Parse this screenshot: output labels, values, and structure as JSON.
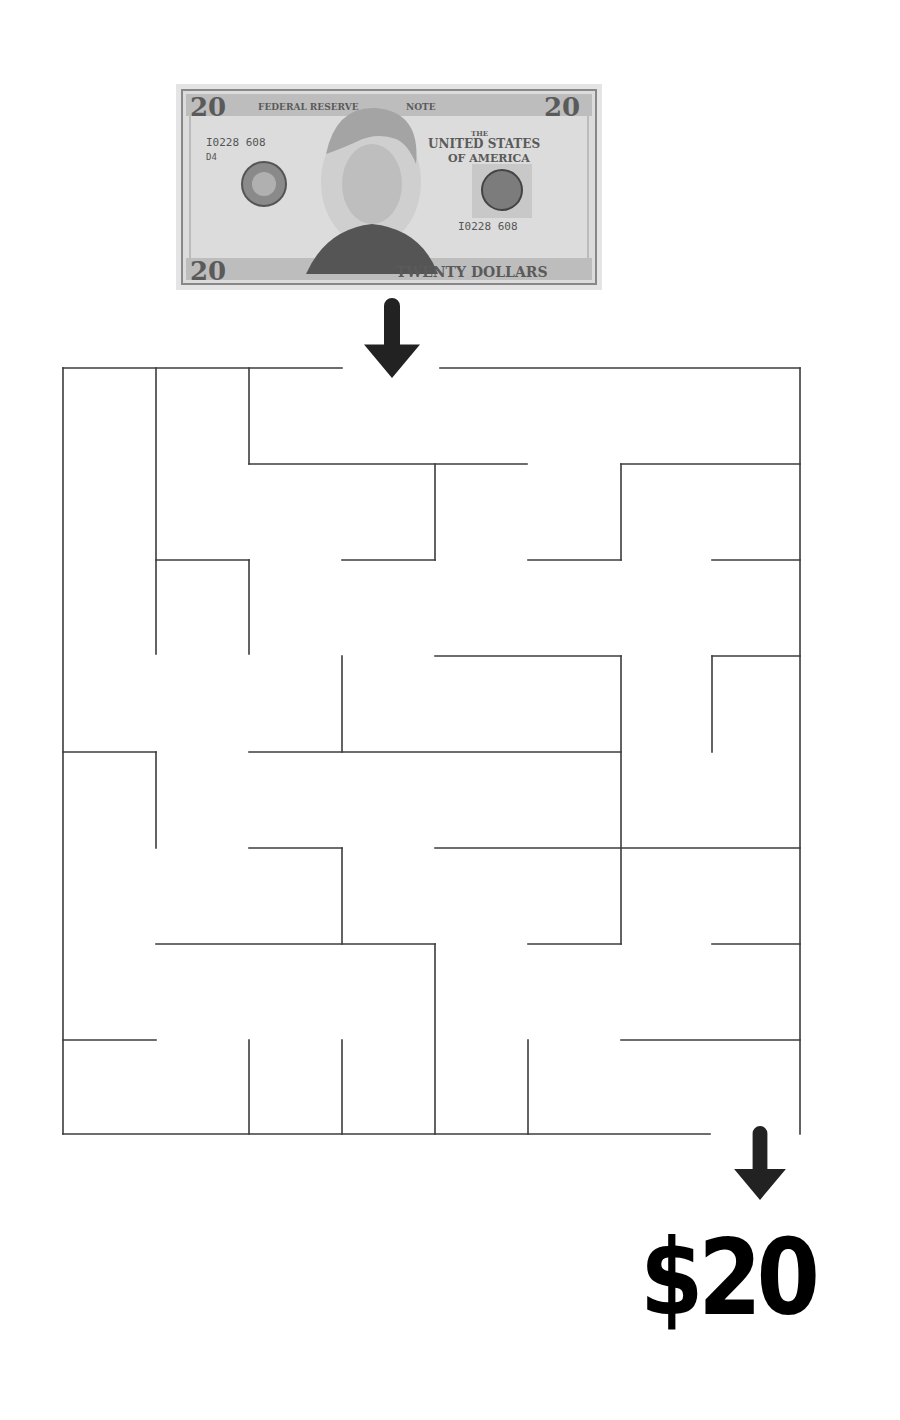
{
  "puzzle": {
    "type": "maze",
    "start_label": "$20 bill image",
    "goal_label": "$20"
  },
  "bill": {
    "denomination_corner": "20",
    "header_left": "FEDERAL RESERVE",
    "header_right": "NOTE",
    "country_line1": "THE",
    "country_line2": "UNITED STATES",
    "country_line3": "OF AMERICA",
    "serial_left": "I0228 608",
    "serial_left_sub": "D4",
    "serial_right": "I0228 608",
    "footer_text": "TWENTY DOLLARS"
  },
  "prize": {
    "text": "$20"
  },
  "colors": {
    "wall": "#3c3c3c",
    "arrow": "#222222",
    "prize": "#000000",
    "bill_bg": "#e4e4e4"
  },
  "maze": {
    "stroke_width": 1.6,
    "cols": 8,
    "rows": 8,
    "x_grid": [
      63,
      156,
      249,
      342,
      435,
      528,
      621,
      714,
      800
    ],
    "y_grid": [
      368,
      464,
      560,
      656,
      752,
      848,
      944,
      1040,
      1134
    ],
    "entrance": {
      "x1": 342,
      "x2": 440,
      "y": 368
    },
    "exit": {
      "x1": 710,
      "x2": 800,
      "y": 1134
    },
    "walls": [
      [
        63,
        368,
        342,
        368
      ],
      [
        440,
        368,
        800,
        368
      ],
      [
        63,
        368,
        63,
        1134
      ],
      [
        800,
        368,
        800,
        1134
      ],
      [
        63,
        1134,
        710,
        1134
      ],
      [
        156,
        368,
        156,
        654
      ],
      [
        249,
        368,
        249,
        464
      ],
      [
        249,
        464,
        527,
        464
      ],
      [
        435,
        464,
        435,
        560
      ],
      [
        342,
        560,
        435,
        560
      ],
      [
        156,
        560,
        249,
        560
      ],
      [
        249,
        560,
        249,
        654
      ],
      [
        528,
        560,
        621,
        560
      ],
      [
        621,
        464,
        621,
        560
      ],
      [
        621,
        464,
        800,
        464
      ],
      [
        712,
        560,
        800,
        560
      ],
      [
        342,
        656,
        342,
        752
      ],
      [
        435,
        656,
        621,
        656
      ],
      [
        621,
        656,
        621,
        944
      ],
      [
        712,
        656,
        800,
        656
      ],
      [
        712,
        656,
        712,
        752
      ],
      [
        249,
        752,
        621,
        752
      ],
      [
        63,
        752,
        156,
        752
      ],
      [
        156,
        752,
        156,
        848
      ],
      [
        249,
        848,
        342,
        848
      ],
      [
        342,
        848,
        342,
        944
      ],
      [
        435,
        848,
        800,
        848
      ],
      [
        528,
        944,
        621,
        944
      ],
      [
        712,
        944,
        800,
        944
      ],
      [
        156,
        944,
        435,
        944
      ],
      [
        435,
        944,
        435,
        1134
      ],
      [
        63,
        1040,
        156,
        1040
      ],
      [
        249,
        1040,
        249,
        1134
      ],
      [
        342,
        1040,
        342,
        1134
      ],
      [
        528,
        1040,
        528,
        1134
      ],
      [
        621,
        1040,
        800,
        1040
      ]
    ]
  },
  "arrows": [
    {
      "name": "start-arrow",
      "cx": 392,
      "top": 298,
      "bottom": 378
    },
    {
      "name": "end-arrow",
      "cx": 760,
      "top": 1126,
      "bottom": 1200
    }
  ]
}
